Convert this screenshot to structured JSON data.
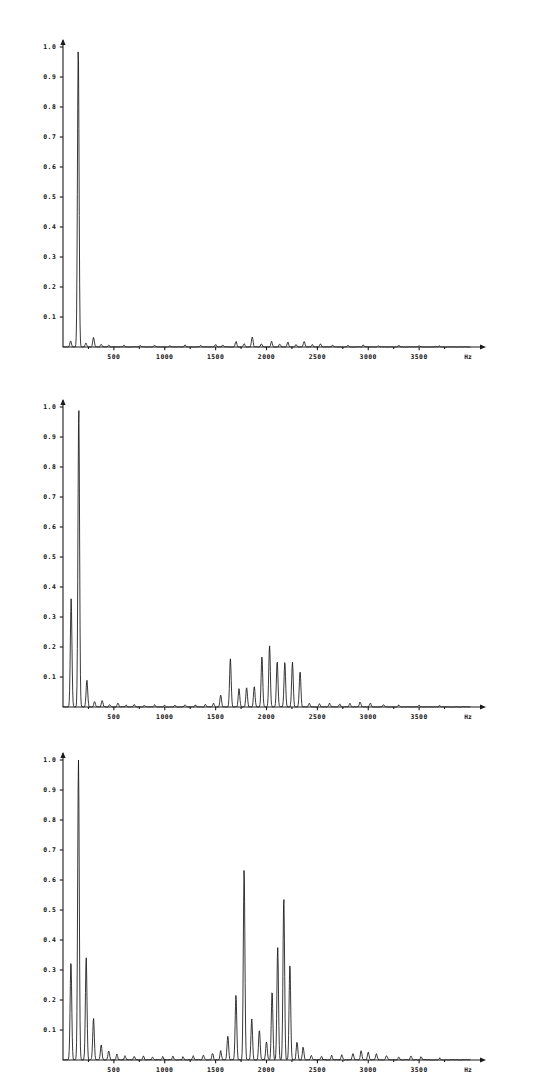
{
  "figure": {
    "background_color": "#ffffff",
    "ink_color": "#151515",
    "panel_count": 3
  },
  "chart_data": [
    {
      "type": "line",
      "title": "",
      "subtitle": "",
      "xlabel": "Hz",
      "ylabel": "",
      "xlim": [
        0,
        4000
      ],
      "ylim": [
        0,
        1.05
      ],
      "grid": false,
      "legend": null,
      "xticks": [
        500,
        1000,
        1500,
        2000,
        2500,
        3000,
        3500
      ],
      "xticklabels": [
        "500",
        "1000",
        "1500",
        "2000",
        "2500",
        "3000",
        "3500"
      ],
      "yticks": [
        0.1,
        0.2,
        0.3,
        0.4,
        0.5,
        0.6,
        0.7,
        0.8,
        0.9,
        1.0
      ],
      "yticklabels": [
        "0.1",
        "0.2",
        "0.3",
        "0.4",
        "0.5",
        "0.6",
        "0.7",
        "0.8",
        "0.9",
        "1.0"
      ],
      "unit_label": "Hz",
      "annotations": [],
      "peaks": [
        {
          "x": 75,
          "y": 0.02
        },
        {
          "x": 150,
          "y": 1.0
        },
        {
          "x": 225,
          "y": 0.013
        },
        {
          "x": 300,
          "y": 0.032
        },
        {
          "x": 375,
          "y": 0.009
        },
        {
          "x": 450,
          "y": 0.006
        },
        {
          "x": 600,
          "y": 0.005
        },
        {
          "x": 760,
          "y": 0.004
        },
        {
          "x": 900,
          "y": 0.005
        },
        {
          "x": 1050,
          "y": 0.004
        },
        {
          "x": 1200,
          "y": 0.006
        },
        {
          "x": 1350,
          "y": 0.005
        },
        {
          "x": 1500,
          "y": 0.008
        },
        {
          "x": 1570,
          "y": 0.006
        },
        {
          "x": 1700,
          "y": 0.018
        },
        {
          "x": 1780,
          "y": 0.01
        },
        {
          "x": 1860,
          "y": 0.034
        },
        {
          "x": 1950,
          "y": 0.01
        },
        {
          "x": 2050,
          "y": 0.018
        },
        {
          "x": 2130,
          "y": 0.009
        },
        {
          "x": 2210,
          "y": 0.016
        },
        {
          "x": 2290,
          "y": 0.008
        },
        {
          "x": 2370,
          "y": 0.018
        },
        {
          "x": 2450,
          "y": 0.008
        },
        {
          "x": 2530,
          "y": 0.01
        },
        {
          "x": 2650,
          "y": 0.006
        },
        {
          "x": 2800,
          "y": 0.005
        },
        {
          "x": 2950,
          "y": 0.006
        },
        {
          "x": 3100,
          "y": 0.004
        },
        {
          "x": 3300,
          "y": 0.005
        },
        {
          "x": 3500,
          "y": 0.004
        },
        {
          "x": 3700,
          "y": 0.003
        }
      ],
      "peak_width": 11,
      "noise": 0.0022,
      "noise_seed": 11
    },
    {
      "type": "line",
      "title": "",
      "subtitle": "",
      "xlabel": "Hz",
      "ylabel": "",
      "xlim": [
        0,
        4000
      ],
      "ylim": [
        0,
        1.05
      ],
      "grid": false,
      "legend": null,
      "xticks": [
        500,
        1000,
        1500,
        2000,
        2500,
        3000,
        3500
      ],
      "xticklabels": [
        "500",
        "1000",
        "1500",
        "2000",
        "2500",
        "3000",
        "3500"
      ],
      "yticks": [
        0.1,
        0.2,
        0.3,
        0.4,
        0.5,
        0.6,
        0.7,
        0.8,
        0.9,
        1.0
      ],
      "yticklabels": [
        "0.1",
        "0.2",
        "0.3",
        "0.4",
        "0.5",
        "0.6",
        "0.7",
        "0.8",
        "0.9",
        "1.0"
      ],
      "unit_label": "Hz",
      "annotations": [],
      "peaks": [
        {
          "x": 80,
          "y": 0.36
        },
        {
          "x": 155,
          "y": 1.0
        },
        {
          "x": 235,
          "y": 0.09
        },
        {
          "x": 310,
          "y": 0.018
        },
        {
          "x": 385,
          "y": 0.022
        },
        {
          "x": 460,
          "y": 0.008
        },
        {
          "x": 540,
          "y": 0.012
        },
        {
          "x": 620,
          "y": 0.006
        },
        {
          "x": 700,
          "y": 0.008
        },
        {
          "x": 800,
          "y": 0.006
        },
        {
          "x": 900,
          "y": 0.007
        },
        {
          "x": 1000,
          "y": 0.006
        },
        {
          "x": 1100,
          "y": 0.006
        },
        {
          "x": 1200,
          "y": 0.007
        },
        {
          "x": 1300,
          "y": 0.006
        },
        {
          "x": 1400,
          "y": 0.008
        },
        {
          "x": 1480,
          "y": 0.012
        },
        {
          "x": 1550,
          "y": 0.04
        },
        {
          "x": 1645,
          "y": 0.16
        },
        {
          "x": 1730,
          "y": 0.06
        },
        {
          "x": 1805,
          "y": 0.065
        },
        {
          "x": 1880,
          "y": 0.068
        },
        {
          "x": 1955,
          "y": 0.168
        },
        {
          "x": 2030,
          "y": 0.205
        },
        {
          "x": 2105,
          "y": 0.152
        },
        {
          "x": 2180,
          "y": 0.148
        },
        {
          "x": 2255,
          "y": 0.148
        },
        {
          "x": 2330,
          "y": 0.118
        },
        {
          "x": 2420,
          "y": 0.012
        },
        {
          "x": 2520,
          "y": 0.01
        },
        {
          "x": 2620,
          "y": 0.012
        },
        {
          "x": 2720,
          "y": 0.01
        },
        {
          "x": 2820,
          "y": 0.012
        },
        {
          "x": 2920,
          "y": 0.016
        },
        {
          "x": 3020,
          "y": 0.012
        },
        {
          "x": 3150,
          "y": 0.008
        },
        {
          "x": 3300,
          "y": 0.006
        },
        {
          "x": 3500,
          "y": 0.006
        },
        {
          "x": 3700,
          "y": 0.004
        }
      ],
      "peak_width": 11,
      "noise": 0.0024,
      "noise_seed": 23
    },
    {
      "type": "line",
      "title": "",
      "subtitle": "",
      "xlabel": "Hz",
      "ylabel": "",
      "xlim": [
        0,
        4000
      ],
      "ylim": [
        0,
        1.05
      ],
      "grid": false,
      "legend": null,
      "xticks": [
        500,
        1000,
        1500,
        2000,
        2500,
        3000,
        3500
      ],
      "xticklabels": [
        "500",
        "1000",
        "1500",
        "2000",
        "2500",
        "3000",
        "3500"
      ],
      "yticks": [
        0.1,
        0.2,
        0.3,
        0.4,
        0.5,
        0.6,
        0.7,
        0.8,
        0.9,
        1.0
      ],
      "yticklabels": [
        "0.1",
        "0.2",
        "0.3",
        "0.4",
        "0.5",
        "0.6",
        "0.7",
        "0.8",
        "0.9",
        "1.0"
      ],
      "unit_label": "Hz",
      "annotations": [],
      "peaks": [
        {
          "x": 78,
          "y": 0.33
        },
        {
          "x": 152,
          "y": 1.0
        },
        {
          "x": 228,
          "y": 0.34
        },
        {
          "x": 300,
          "y": 0.138
        },
        {
          "x": 375,
          "y": 0.05
        },
        {
          "x": 450,
          "y": 0.03
        },
        {
          "x": 530,
          "y": 0.018
        },
        {
          "x": 610,
          "y": 0.014
        },
        {
          "x": 700,
          "y": 0.012
        },
        {
          "x": 790,
          "y": 0.012
        },
        {
          "x": 880,
          "y": 0.01
        },
        {
          "x": 980,
          "y": 0.01
        },
        {
          "x": 1080,
          "y": 0.012
        },
        {
          "x": 1180,
          "y": 0.01
        },
        {
          "x": 1280,
          "y": 0.014
        },
        {
          "x": 1380,
          "y": 0.016
        },
        {
          "x": 1470,
          "y": 0.022
        },
        {
          "x": 1550,
          "y": 0.03
        },
        {
          "x": 1620,
          "y": 0.08
        },
        {
          "x": 1700,
          "y": 0.215
        },
        {
          "x": 1780,
          "y": 0.635
        },
        {
          "x": 1855,
          "y": 0.135
        },
        {
          "x": 1930,
          "y": 0.1
        },
        {
          "x": 2000,
          "y": 0.06
        },
        {
          "x": 2055,
          "y": 0.23
        },
        {
          "x": 2110,
          "y": 0.375
        },
        {
          "x": 2170,
          "y": 0.545
        },
        {
          "x": 2230,
          "y": 0.32
        },
        {
          "x": 2300,
          "y": 0.06
        },
        {
          "x": 2360,
          "y": 0.042
        },
        {
          "x": 2440,
          "y": 0.014
        },
        {
          "x": 2540,
          "y": 0.012
        },
        {
          "x": 2640,
          "y": 0.014
        },
        {
          "x": 2740,
          "y": 0.016
        },
        {
          "x": 2850,
          "y": 0.022
        },
        {
          "x": 2930,
          "y": 0.03
        },
        {
          "x": 3000,
          "y": 0.026
        },
        {
          "x": 3080,
          "y": 0.02
        },
        {
          "x": 3180,
          "y": 0.014
        },
        {
          "x": 3300,
          "y": 0.01
        },
        {
          "x": 3420,
          "y": 0.014
        },
        {
          "x": 3520,
          "y": 0.01
        },
        {
          "x": 3700,
          "y": 0.006
        }
      ],
      "peak_width": 11,
      "noise": 0.0035,
      "noise_seed": 37
    }
  ]
}
